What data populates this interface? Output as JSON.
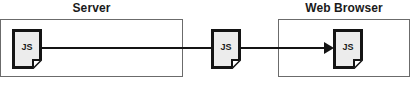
{
  "diagram": {
    "width": 417,
    "height": 90,
    "background_color": "#ffffff",
    "line_color": "#141414",
    "box_border_color": "#6b6b6b",
    "icon_fill_color": "#ececec",
    "icon_border_color": "#141414",
    "text_color": "#1a1a1a"
  },
  "groups": [
    {
      "id": "server",
      "label": "Server"
    },
    {
      "id": "browser",
      "label": "Web Browser"
    }
  ],
  "nodes": [
    {
      "id": "js-server",
      "label": "JS",
      "icon": "document-icon",
      "group": "server"
    },
    {
      "id": "js-wire",
      "label": "JS",
      "icon": "document-icon",
      "group": "none"
    },
    {
      "id": "js-browser",
      "label": "JS",
      "icon": "document-icon",
      "group": "browser"
    }
  ],
  "connections": [
    {
      "id": "server-to-wire",
      "from": "js-server",
      "to": "js-wire",
      "arrow": false
    },
    {
      "id": "wire-to-browser",
      "from": "js-wire",
      "to": "js-browser",
      "arrow": true
    }
  ]
}
